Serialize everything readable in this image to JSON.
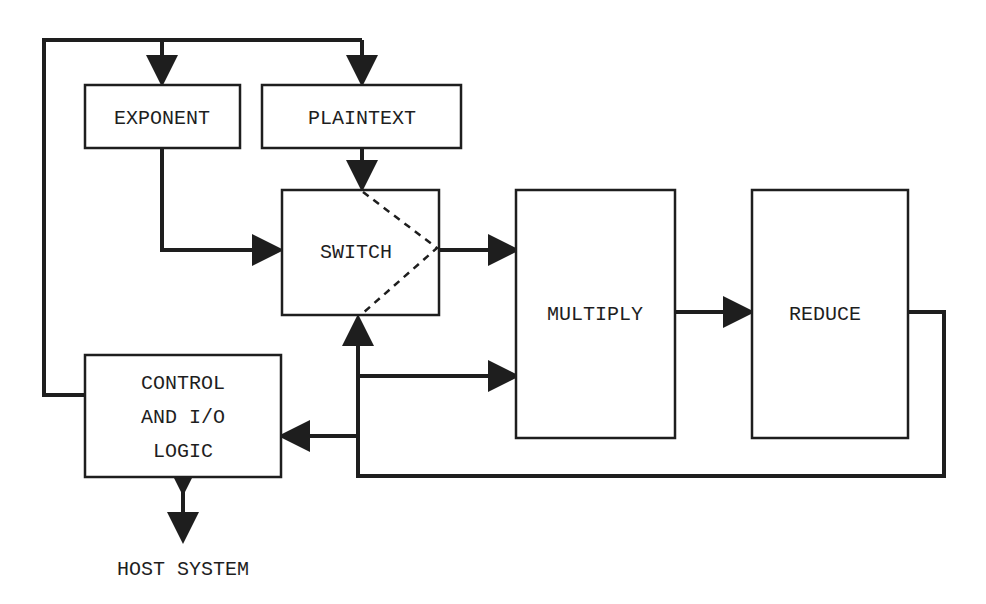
{
  "diagram": {
    "blocks": {
      "exponent": {
        "label": "EXPONENT"
      },
      "plaintext": {
        "label": "PLAINTEXT"
      },
      "switch": {
        "label": "SWITCH"
      },
      "multiply": {
        "label": "MULTIPLY"
      },
      "reduce": {
        "label": "REDUCE"
      },
      "control": {
        "line1": "CONTROL",
        "line2": "AND I/O",
        "line3": "LOGIC"
      }
    },
    "external": {
      "host": "HOST SYSTEM"
    },
    "colors": {
      "ink": "#1e1e1e",
      "background": "#ffffff"
    }
  }
}
